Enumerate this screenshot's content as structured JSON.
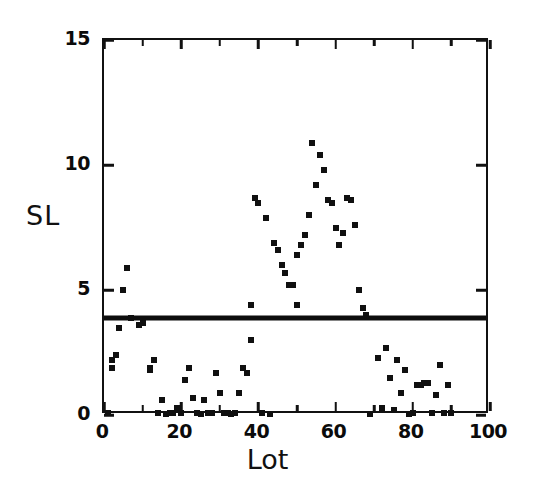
{
  "chart_data": {
    "type": "scatter",
    "title": "",
    "subtitle": "",
    "xlabel": "Lot",
    "ylabel": "SL",
    "xlim": [
      0,
      100
    ],
    "ylim": [
      0,
      15
    ],
    "xticks": [
      0,
      20,
      40,
      60,
      80,
      100
    ],
    "xtick_labels": [
      "0",
      "20",
      "40",
      "60",
      "80",
      "100"
    ],
    "xticks_minor": [
      10,
      30,
      50,
      70,
      90
    ],
    "yticks": [
      0,
      5,
      10,
      15
    ],
    "ytick_labels": [
      "0",
      "5",
      "10",
      "15"
    ],
    "grid": false,
    "legend": null,
    "legend_position": "none",
    "marker": "square",
    "marker_color": "#101010",
    "marker_size_px": 6,
    "annotations": [
      {
        "kind": "horizontal-threshold-line",
        "y": 3.9,
        "color": "#0d0d0d",
        "linewidth_px": 5,
        "label": ""
      }
    ],
    "series": [
      {
        "name": "SL",
        "points": [
          [
            1,
            0.1
          ],
          [
            2,
            2.2
          ],
          [
            2,
            1.9
          ],
          [
            3,
            2.4
          ],
          [
            4,
            3.5
          ],
          [
            5,
            5.0
          ],
          [
            6,
            5.9
          ],
          [
            7,
            3.9
          ],
          [
            9,
            3.6
          ],
          [
            10,
            3.7
          ],
          [
            12,
            1.9
          ],
          [
            12,
            1.8
          ],
          [
            13,
            2.2
          ],
          [
            14,
            0.1
          ],
          [
            15,
            0.6
          ],
          [
            16,
            0.05
          ],
          [
            17,
            0.1
          ],
          [
            18,
            0.1
          ],
          [
            19,
            0.3
          ],
          [
            20,
            0.1
          ],
          [
            21,
            1.4
          ],
          [
            22,
            1.9
          ],
          [
            23,
            0.7
          ],
          [
            24,
            0.1
          ],
          [
            25,
            0.05
          ],
          [
            26,
            0.6
          ],
          [
            27,
            0.1
          ],
          [
            28,
            0.1
          ],
          [
            29,
            1.7
          ],
          [
            30,
            0.9
          ],
          [
            31,
            0.1
          ],
          [
            32,
            0.1
          ],
          [
            33,
            0.05
          ],
          [
            34,
            0.1
          ],
          [
            35,
            0.9
          ],
          [
            36,
            1.9
          ],
          [
            37,
            1.7
          ],
          [
            38,
            3.0
          ],
          [
            38,
            4.4
          ],
          [
            39,
            8.7
          ],
          [
            40,
            8.5
          ],
          [
            41,
            0.1
          ],
          [
            42,
            7.9
          ],
          [
            43,
            0.05
          ],
          [
            44,
            6.9
          ],
          [
            45,
            6.6
          ],
          [
            46,
            6.0
          ],
          [
            47,
            5.7
          ],
          [
            48,
            5.2
          ],
          [
            49,
            5.2
          ],
          [
            50,
            6.4
          ],
          [
            50,
            4.4
          ],
          [
            51,
            6.8
          ],
          [
            52,
            7.2
          ],
          [
            53,
            8.0
          ],
          [
            54,
            10.9
          ],
          [
            55,
            9.2
          ],
          [
            56,
            10.4
          ],
          [
            57,
            9.8
          ],
          [
            58,
            8.6
          ],
          [
            59,
            8.5
          ],
          [
            60,
            7.5
          ],
          [
            61,
            6.8
          ],
          [
            62,
            7.3
          ],
          [
            63,
            8.7
          ],
          [
            64,
            8.6
          ],
          [
            65,
            7.6
          ],
          [
            66,
            5.0
          ],
          [
            67,
            4.3
          ],
          [
            68,
            4.0
          ],
          [
            69,
            0.05
          ],
          [
            71,
            2.3
          ],
          [
            72,
            0.3
          ],
          [
            73,
            2.7
          ],
          [
            74,
            1.5
          ],
          [
            75,
            0.2
          ],
          [
            76,
            2.2
          ],
          [
            77,
            0.9
          ],
          [
            78,
            1.8
          ],
          [
            79,
            0.05
          ],
          [
            80,
            0.1
          ],
          [
            81,
            1.2
          ],
          [
            82,
            1.2
          ],
          [
            83,
            1.3
          ],
          [
            84,
            1.3
          ],
          [
            85,
            0.1
          ],
          [
            86,
            0.8
          ],
          [
            87,
            2.0
          ],
          [
            88,
            0.1
          ],
          [
            89,
            1.2
          ],
          [
            90,
            0.1
          ]
        ]
      }
    ]
  }
}
